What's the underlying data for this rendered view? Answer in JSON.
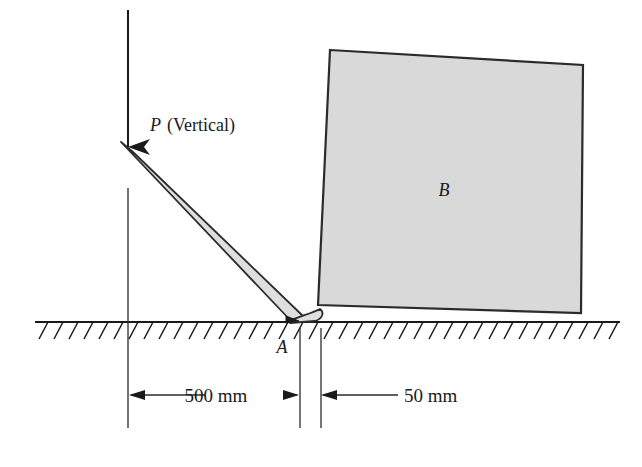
{
  "figure": {
    "domain_type": "engineering-free-body-diagram"
  },
  "labels": {
    "force_symbol": "P",
    "force_qualifier": "(Vertical)",
    "block_label": "B",
    "point_label": "A"
  },
  "dimensions": [
    {
      "id": "dim-500",
      "text": "500 mm",
      "value": 500,
      "unit": "mm",
      "arrows": "both"
    },
    {
      "id": "dim-50",
      "text": "50 mm",
      "value": 50,
      "unit": "mm",
      "arrows": "left"
    }
  ],
  "colors": {
    "line": "#1a1a1a",
    "block_fill": "#d9d9d9",
    "block_stroke": "#2b2b2b",
    "bar_fill": "#dedede",
    "bar_stroke": "#2b2b2b",
    "ground": "#1a1a1a",
    "background": "#ffffff",
    "dimension_line": "#2b2b2b"
  },
  "geometry": {
    "ground_line": {
      "x1": 35,
      "y1": 322,
      "x2": 620,
      "y2": 322
    },
    "hatch": {
      "count": 40,
      "spacing": 15,
      "length": 17,
      "dx": -9,
      "dy": 15
    },
    "force_arrow": {
      "x": 128,
      "y_top": 10,
      "y_bottom": 147
    },
    "bar": {
      "top_x": 122,
      "top_y": 150,
      "bottom_x": 298,
      "bottom_y": 316,
      "thickness": 14
    },
    "block": {
      "top_left": [
        330,
        50
      ],
      "top_right": [
        583,
        65
      ],
      "bottom_right": [
        581,
        313
      ],
      "bottom_left": [
        318,
        305
      ]
    },
    "extension_lines": [
      {
        "x": 128,
        "y1": 188,
        "y2": 428
      },
      {
        "x": 300,
        "y1": 328,
        "y2": 428
      },
      {
        "x": 321,
        "y1": 328,
        "y2": 428
      }
    ],
    "dimension_line_y": 395
  }
}
